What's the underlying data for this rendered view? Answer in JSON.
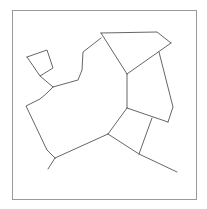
{
  "diagram": {
    "type": "planar-graph",
    "width": 207,
    "height": 209,
    "frame": {
      "x": 12,
      "y": 10,
      "width": 184,
      "height": 189,
      "stroke": "#9a9a9a"
    },
    "edge_color": "#555555",
    "edges": [
      {
        "points": [
          [
            101,
            33
          ],
          [
            157,
            32
          ],
          [
            171,
            43
          ]
        ]
      },
      {
        "points": [
          [
            101,
            33
          ],
          [
            127,
            74
          ]
        ]
      },
      {
        "points": [
          [
            171,
            43
          ],
          [
            127,
            74
          ]
        ]
      },
      {
        "points": [
          [
            127,
            74
          ],
          [
            127,
            108
          ]
        ]
      },
      {
        "points": [
          [
            159,
            52
          ],
          [
            173,
            107
          ],
          [
            168,
            122
          ]
        ]
      },
      {
        "points": [
          [
            127,
            108
          ],
          [
            168,
            122
          ]
        ]
      },
      {
        "points": [
          [
            127,
            108
          ],
          [
            108,
            134
          ]
        ]
      },
      {
        "points": [
          [
            152,
            118
          ],
          [
            139,
            154
          ]
        ]
      },
      {
        "points": [
          [
            108,
            134
          ],
          [
            139,
            154
          ],
          [
            177,
            172
          ]
        ]
      },
      {
        "points": [
          [
            108,
            134
          ],
          [
            55,
            158
          ]
        ]
      },
      {
        "points": [
          [
            55,
            158
          ],
          [
            48,
            169
          ]
        ]
      },
      {
        "points": [
          [
            55,
            158
          ],
          [
            47,
            150
          ],
          [
            26,
            106
          ],
          [
            40,
            99
          ],
          [
            47,
            93
          ],
          [
            53,
            87
          ]
        ]
      },
      {
        "points": [
          [
            53,
            87
          ],
          [
            78,
            80
          ],
          [
            82,
            70
          ],
          [
            83,
            52
          ],
          [
            101,
            38
          ]
        ]
      },
      {
        "points": [
          [
            53,
            87
          ],
          [
            40,
            76
          ]
        ]
      },
      {
        "points": [
          [
            27,
            57
          ],
          [
            47,
            50
          ],
          [
            53,
            68
          ],
          [
            40,
            76
          ],
          [
            27,
            57
          ]
        ]
      }
    ]
  }
}
